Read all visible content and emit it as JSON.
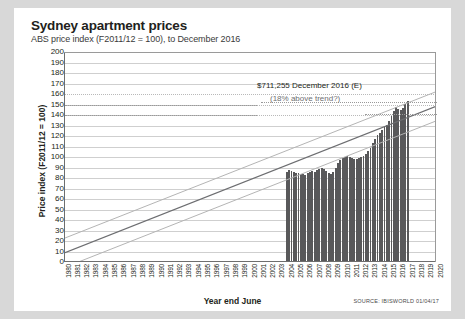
{
  "header": {
    "title": "Sydney apartment prices",
    "subtitle": "ABS price index (F2011/12 = 100), to December 2016"
  },
  "footer": {
    "source": "SOURCE: IBISWORLD 01/04/17"
  },
  "annotations": {
    "line1": "$711,255 December 2016 (E)",
    "line2": "(18% above trend?)"
  },
  "colors": {
    "bar": "#58585a",
    "trend_center": "#6d6e71",
    "trend_band": "#b4b4b4",
    "grid": "#cfcfcf",
    "card": "#ffffff",
    "page": "#d8d8d8"
  },
  "chart_data": {
    "type": "bar",
    "title": "Sydney apartment prices",
    "subtitle": "ABS price index (F2011/12 = 100), to December 2016",
    "xlabel": "Year end June",
    "ylabel": "Price index (F2011/12 = 100)",
    "ylim": [
      0,
      200
    ],
    "ytick_step": 10,
    "yticks": [
      0,
      10,
      20,
      30,
      40,
      50,
      60,
      70,
      80,
      90,
      100,
      110,
      120,
      130,
      140,
      150,
      160,
      170,
      180,
      190,
      200
    ],
    "xlim": [
      1980,
      2020
    ],
    "xticks": [
      1980,
      1981,
      1982,
      1983,
      1984,
      1985,
      1986,
      1987,
      1988,
      1989,
      1990,
      1991,
      1992,
      1993,
      1994,
      1995,
      1996,
      1997,
      1998,
      1999,
      2000,
      2001,
      2002,
      2003,
      2004,
      2005,
      2006,
      2007,
      2008,
      2009,
      2010,
      2011,
      2012,
      2013,
      2014,
      2015,
      2016,
      2017,
      2018,
      2019,
      2020
    ],
    "grid": true,
    "legend": "none",
    "bar_series": {
      "name": "Sydney apartment price index",
      "frequency": "quarterly",
      "x_start": 2003.75,
      "x_end": 2016.75,
      "x": [
        2003.75,
        2004.0,
        2004.25,
        2004.5,
        2004.75,
        2005.0,
        2005.25,
        2005.5,
        2005.75,
        2006.0,
        2006.25,
        2006.5,
        2006.75,
        2007.0,
        2007.25,
        2007.5,
        2007.75,
        2008.0,
        2008.25,
        2008.5,
        2008.75,
        2009.0,
        2009.25,
        2009.5,
        2009.75,
        2010.0,
        2010.25,
        2010.5,
        2010.75,
        2011.0,
        2011.25,
        2011.5,
        2011.75,
        2012.0,
        2012.25,
        2012.5,
        2012.75,
        2013.0,
        2013.25,
        2013.5,
        2013.75,
        2014.0,
        2014.25,
        2014.5,
        2014.75,
        2015.0,
        2015.25,
        2015.5,
        2015.75,
        2016.0,
        2016.25,
        2016.5,
        2016.75
      ],
      "values": [
        85,
        87,
        86,
        85,
        84,
        84,
        83,
        83,
        82,
        84,
        85,
        86,
        85,
        87,
        88,
        89,
        88,
        86,
        84,
        83,
        85,
        89,
        93,
        96,
        98,
        99,
        100,
        99,
        98,
        97,
        97,
        98,
        99,
        100,
        102,
        105,
        108,
        112,
        116,
        120,
        122,
        125,
        128,
        130,
        133,
        138,
        143,
        147,
        145,
        144,
        146,
        150,
        152
      ]
    },
    "trend_lines": [
      {
        "name": "trend-center",
        "x": [
          1980,
          2020
        ],
        "y": [
          8,
          148
        ],
        "style": "solid",
        "color": "#6d6e71"
      },
      {
        "name": "trend-upper",
        "x": [
          1980,
          2020
        ],
        "y": [
          22,
          162
        ],
        "style": "solid",
        "color": "#b4b4b4"
      },
      {
        "name": "trend-lower",
        "x": [
          1980,
          2020
        ],
        "y": [
          -6,
          134
        ],
        "style": "solid",
        "color": "#b4b4b4"
      }
    ],
    "callout": {
      "value_label": "$711,255 December 2016 (E)",
      "note": "(18% above trend?)",
      "at_x": 2016.75,
      "at_y": 152
    }
  }
}
